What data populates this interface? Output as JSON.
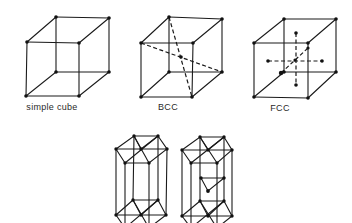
{
  "figure": {
    "panels": [
      {
        "id": "simple-cube",
        "label": "simple cube",
        "label_pos": [
          52,
          102
        ]
      },
      {
        "id": "bcc",
        "label": "BCC",
        "label_pos": [
          168,
          102
        ]
      },
      {
        "id": "fcc",
        "label": "FCC",
        "label_pos": [
          280,
          103
        ]
      }
    ],
    "bottom_panels": [
      {
        "id": "hcp-left",
        "label": ""
      },
      {
        "id": "hcp-right",
        "label": ""
      }
    ]
  },
  "colors": {
    "line": "#1a1a1a",
    "atom": "#111111",
    "background": "#ffffff"
  }
}
